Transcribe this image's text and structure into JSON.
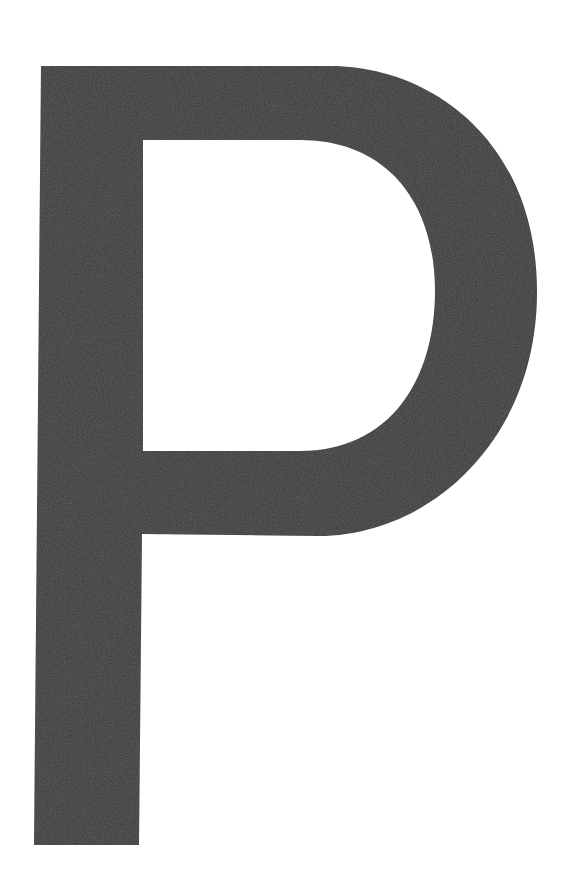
{
  "image": {
    "kind": "scanned-letterform",
    "character": "P",
    "description": "Large dark uppercase letter P on a plain white page",
    "width": 574,
    "height": 893
  },
  "colors": {
    "background": "#ffffff",
    "glyph": "#3a3a3a",
    "glyph_shadow": "#2f2f2f",
    "counter": "#ffffff"
  },
  "glyph": {
    "label": "P",
    "stem": {
      "top_left_x": 41,
      "bottom_left_x": 34,
      "top_right_x": 141,
      "bottom_right_x": 139,
      "top_y": 66,
      "bottom_y": 845
    },
    "bowl": {
      "top_y": 66,
      "flat_top_end_x": 330,
      "right_extent_x": 537,
      "right_extent_y": 290,
      "bottom_y": 535
    },
    "counter": {
      "left_x": 143,
      "top_y": 140,
      "right_x": 435,
      "right_y": 290,
      "bottom_y": 450
    },
    "path": "M 41 66 L 330 66 C 430 66 537 140 537 292 C 537 440 430 536 318 536 L 142 534 L 139 845 L 34 845 Z M 143 140 L 143 451 L 300 451 C 390 451 435 380 435 291 C 435 200 385 140 300 140 Z"
  },
  "caption": "P"
}
